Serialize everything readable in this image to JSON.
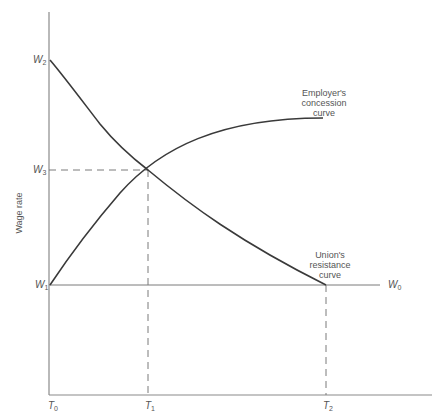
{
  "diagram": {
    "axis_label_y": "Wage rate",
    "y_ticks": [
      {
        "id": "W2",
        "base": "W",
        "sub": "2"
      },
      {
        "id": "W3",
        "base": "W",
        "sub": "3"
      },
      {
        "id": "W1",
        "base": "W",
        "sub": "1"
      },
      {
        "id": "W0",
        "base": "W",
        "sub": "0"
      }
    ],
    "x_ticks": [
      {
        "id": "T0",
        "base": "T",
        "sub": "0"
      },
      {
        "id": "T1",
        "base": "T",
        "sub": "1"
      },
      {
        "id": "T2",
        "base": "T",
        "sub": "2"
      }
    ],
    "curves": {
      "employer": {
        "line1": "Employer's",
        "line2": "concession",
        "line3": "curve"
      },
      "union": {
        "line1": "Union's",
        "line2": "resistance",
        "line3": "curve"
      }
    },
    "colors": {
      "axis": "#8a8a8a",
      "curve": "#3a3a3a",
      "dashed": "#7a7a7a",
      "text": "#555555"
    }
  }
}
